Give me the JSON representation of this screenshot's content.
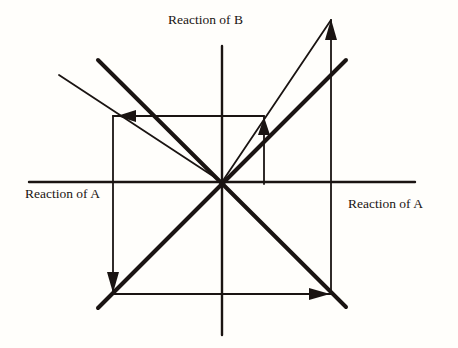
{
  "labels": {
    "vertical_axis": "Reaction of B",
    "horizontal_axis_left": "Reaction of A",
    "horizontal_axis_right": "Reaction of A"
  },
  "colors": {
    "ink": "#1a1412",
    "background": "#fffefb"
  },
  "elements": {
    "axes": [
      "horizontal-axis",
      "vertical-axis"
    ],
    "thick_lines": [
      "reaction-line-nw-se",
      "reaction-line-sw-ne"
    ],
    "thin_lines": [
      "thin-ray-upper-left",
      "thin-ray-upper-right"
    ],
    "path_arrows": [
      "arrow-up-inner",
      "arrow-up-outer",
      "arrow-left-top",
      "arrow-down-left",
      "arrow-right-bottom"
    ]
  }
}
